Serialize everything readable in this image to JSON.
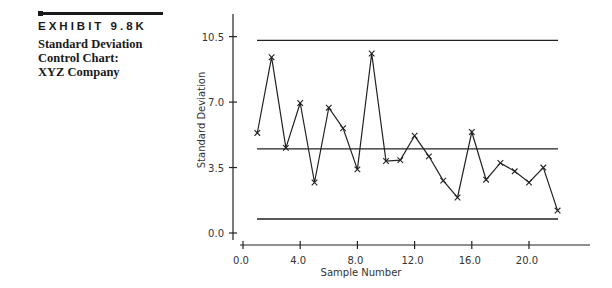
{
  "sidebar": {
    "exhibit": "EXHIBIT 9.8K",
    "title_lines": [
      "Standard Deviation",
      "Control Chart:",
      "XYZ Company"
    ]
  },
  "chart_data": {
    "type": "line",
    "title": "Standard Deviation Control Chart: XYZ Company",
    "xlabel": "Sample Number",
    "ylabel": "Standard Deviation",
    "xticks": [
      "0.0",
      "4.0",
      "8.0",
      "12.0",
      "16.0",
      "20.0"
    ],
    "yticks": [
      "0.0",
      "3.5",
      "7.0",
      "10.5"
    ],
    "xlim": [
      0,
      23
    ],
    "ylim": [
      0,
      11.5
    ],
    "grid": false,
    "marker": "x",
    "x": [
      1,
      2,
      3,
      4,
      5,
      6,
      7,
      8,
      9,
      10,
      11,
      12,
      13,
      14,
      15,
      16,
      17,
      18,
      19,
      20,
      21,
      22
    ],
    "series": [
      {
        "name": "Sample Standard Deviation",
        "values": [
          5.35,
          9.4,
          4.55,
          6.95,
          2.7,
          6.7,
          5.6,
          3.4,
          9.6,
          3.85,
          3.9,
          5.2,
          4.1,
          2.8,
          1.9,
          5.4,
          2.85,
          3.75,
          3.3,
          2.7,
          3.5,
          1.2
        ]
      }
    ],
    "control_lines": {
      "UCL": 10.3,
      "CL": 4.5,
      "LCL": 0.75
    }
  }
}
